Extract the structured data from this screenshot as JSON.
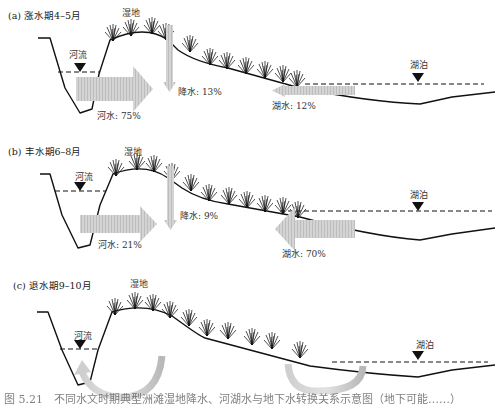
{
  "panels": [
    {
      "id": "a",
      "title": "(a) 涨水期4–5月",
      "wetland_label": "湿地",
      "river_label": "河流",
      "lake_label": "湖泊",
      "flows": {
        "river": {
          "label": "河水: 75%",
          "value": 75
        },
        "precipitation": {
          "label": "降水: 13%",
          "value": 13
        },
        "lake": {
          "label": "湖水: 12%",
          "value": 12
        }
      }
    },
    {
      "id": "b",
      "title": "(b) 丰水期6–8月",
      "wetland_label": "湿地",
      "river_label": "河流",
      "lake_label": "湖泊",
      "flows": {
        "river": {
          "label": "河水: 21%",
          "value": 21
        },
        "precipitation": {
          "label": "降水: 9%",
          "value": 9
        },
        "lake": {
          "label": "湖水: 70%",
          "value": 70
        }
      }
    },
    {
      "id": "c",
      "title": "(c) 退水期9–10月",
      "wetland_label": "湿地",
      "river_label": "河流",
      "lake_label": "湖泊",
      "flows": {
        "river_return": {
          "label": ""
        },
        "lake_return": {
          "label": ""
        }
      }
    }
  ],
  "caption": "图 5.21　不同水文时期典型洲滩湿地降水、河湖水与地下水转换关系示意图（地下可能……）",
  "colors": {
    "ground_line": "#111111",
    "arrow_fill": "#c8c8c8",
    "text": "#333333"
  }
}
